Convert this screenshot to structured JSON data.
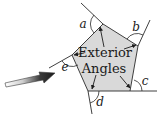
{
  "diagram": {
    "title_line1": "Exterior",
    "title_line2": "Angles",
    "angle_labels": {
      "a": "a",
      "b": "b",
      "c": "c",
      "d": "d",
      "e": "e"
    },
    "colors": {
      "background": "#ffffff",
      "pentagon_fill": "#d9d9d9",
      "stroke": "#2a2a2a",
      "arrow_fill": "#1e1e1e",
      "pointer_arrow_dark": "#2b2b2b",
      "pointer_arrow_light": "#ffffff"
    }
  }
}
